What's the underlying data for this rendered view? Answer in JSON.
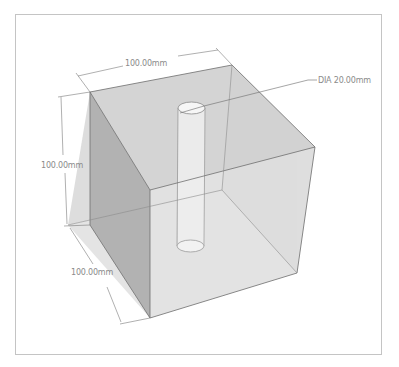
{
  "diagram": {
    "type": "3d-isometric-model",
    "colors": {
      "background": "#ffffff",
      "frame": "#c4c4c4",
      "top_face": "#d6d6d6",
      "left_face": "#b4b4b4",
      "right_face": "#cbcbcb",
      "bottom_face": "#e6e6e6",
      "edge": "#6e6e6e",
      "dimension_line": "#7a7a7a",
      "label": "#8a8a8a",
      "cylinder": "#ececec"
    },
    "dimensions": {
      "width_label": "100.00mm",
      "height_label": "100.00mm",
      "depth_label": "100.00mm",
      "hole_label": "DIA 20.00mm"
    }
  }
}
